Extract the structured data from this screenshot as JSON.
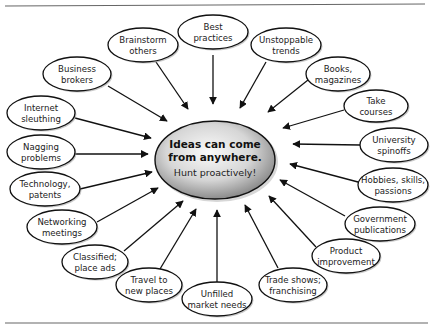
{
  "center": {
    "title_lines": [
      "Ideas can come",
      "from anywhere."
    ],
    "subtitle": "Hunt proactively!"
  },
  "nodes": [
    {
      "id": "best-practices",
      "lines": [
        "Best",
        "practices"
      ]
    },
    {
      "id": "unstoppable-trends",
      "lines": [
        "Unstoppable",
        "trends"
      ]
    },
    {
      "id": "books-magazines",
      "lines": [
        "Books,",
        "magazines"
      ]
    },
    {
      "id": "take-courses",
      "lines": [
        "Take",
        "courses"
      ]
    },
    {
      "id": "university-spinoffs",
      "lines": [
        "University",
        "spinoffs"
      ]
    },
    {
      "id": "hobbies-skills-passions",
      "lines": [
        "Hobbies, skills,",
        "passions"
      ]
    },
    {
      "id": "government-publications",
      "lines": [
        "Government",
        "publications"
      ]
    },
    {
      "id": "product-improvement",
      "lines": [
        "Product",
        "improvement"
      ]
    },
    {
      "id": "trade-shows-franchising",
      "lines": [
        "Trade shows;",
        "franchising"
      ]
    },
    {
      "id": "unfilled-market-needs",
      "lines": [
        "Unfilled",
        "market needs"
      ]
    },
    {
      "id": "travel-to-new-places",
      "lines": [
        "Travel to",
        "new places"
      ]
    },
    {
      "id": "classified-place-ads",
      "lines": [
        "Classified;",
        "place ads"
      ]
    },
    {
      "id": "networking-meetings",
      "lines": [
        "Networking",
        "meetings"
      ]
    },
    {
      "id": "technology-patents",
      "lines": [
        "Technology,",
        "patents"
      ]
    },
    {
      "id": "nagging-problems",
      "lines": [
        "Nagging",
        "problems"
      ]
    },
    {
      "id": "internet-sleuthing",
      "lines": [
        "Internet",
        "sleuthing"
      ]
    },
    {
      "id": "business-brokers",
      "lines": [
        "Business",
        "brokers"
      ]
    },
    {
      "id": "brainstorm-others",
      "lines": [
        "Brainstorm",
        "others"
      ]
    }
  ],
  "colors": {
    "stroke": "#111111",
    "node_fill": "#ffffff",
    "center_light": "#f4f4f4",
    "center_dark": "#8a8a8a",
    "rule": "#555555"
  }
}
